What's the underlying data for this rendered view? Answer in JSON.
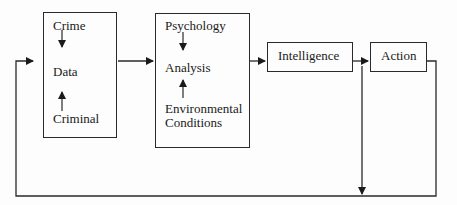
{
  "diagram": {
    "type": "flowchart",
    "nodes": {
      "collection": {
        "top": "Crime",
        "middle": "Data",
        "bottom": "Criminal"
      },
      "analysis": {
        "top": "Psychology",
        "middle": "Analysis",
        "bottom_line1": "Environmental",
        "bottom_line2": "Conditions"
      },
      "intelligence": {
        "label": "Intelligence"
      },
      "action": {
        "label": "Action"
      }
    },
    "edges": [
      {
        "from": "Crime",
        "to": "Data"
      },
      {
        "from": "Criminal",
        "to": "Data"
      },
      {
        "from": "Psychology",
        "to": "Analysis"
      },
      {
        "from": "Environmental Conditions",
        "to": "Analysis"
      },
      {
        "from": "collection",
        "to": "analysis"
      },
      {
        "from": "analysis",
        "to": "intelligence"
      },
      {
        "from": "intelligence",
        "to": "action"
      },
      {
        "from": "action",
        "to": "collection",
        "kind": "feedback loop"
      },
      {
        "from": "intelligence",
        "to": "feedback loop",
        "kind": "down arrow"
      }
    ],
    "colors": {
      "line": "#2a2a2a",
      "background": "#fdfdfd"
    }
  }
}
